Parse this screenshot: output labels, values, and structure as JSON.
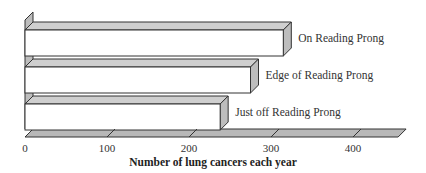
{
  "chart_data": {
    "type": "bar",
    "orientation": "horizontal",
    "style": "3d",
    "title": "",
    "categories": [
      "On Reading Prong",
      "Edge of Reading Prong",
      "Just off Reading Prong"
    ],
    "values": [
      315,
      275,
      238
    ],
    "xlabel": "Number of lung cancers each year",
    "ylabel": "",
    "xlim": [
      0,
      450
    ],
    "x_ticks": [
      0,
      100,
      200,
      300,
      400
    ],
    "x_tick_labels": [
      "0",
      "100",
      "200",
      "300",
      "400"
    ],
    "grid": false,
    "legend": null,
    "colors": {
      "bar_face": "#ffffff",
      "bar_top": "#cfcfcf",
      "bar_side": "#bdbdbd",
      "floor": "#b8b8b8",
      "stroke": "#333333"
    }
  }
}
